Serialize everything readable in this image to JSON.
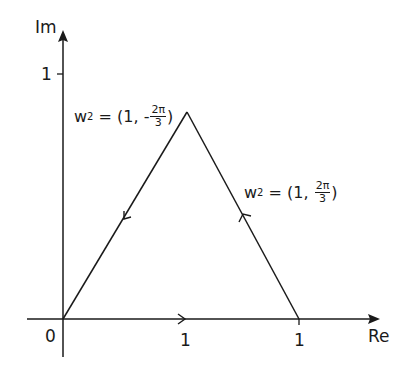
{
  "diagram": {
    "title": "",
    "axes": {
      "x_label": "Re",
      "y_label": "Im",
      "origin_label": "0",
      "y_tick_label": "1",
      "x_tick_labels": [
        "1",
        "1"
      ]
    },
    "vertices": [
      {
        "name": "origin",
        "x": 0,
        "y": 0
      },
      {
        "name": "apex",
        "x": 0.5,
        "y": 0.866
      },
      {
        "name": "right",
        "x": 1,
        "y": 0
      }
    ],
    "edges": [
      {
        "from": "origin",
        "to": "right",
        "direction": "rightward"
      },
      {
        "from": "right",
        "to": "apex",
        "direction": "up-left"
      },
      {
        "from": "apex",
        "to": "origin",
        "direction": "down-left"
      }
    ],
    "labels": {
      "left_edge": {
        "lhs": "w",
        "exp": "2",
        "eq": " = (1, ",
        "sign": "-",
        "num": "2π",
        "den": "3",
        "close": ")"
      },
      "right_edge": {
        "lhs": "w",
        "exp": "2",
        "eq": " = (1, ",
        "sign": "",
        "num": "2π",
        "den": "3",
        "close": ")"
      }
    }
  }
}
